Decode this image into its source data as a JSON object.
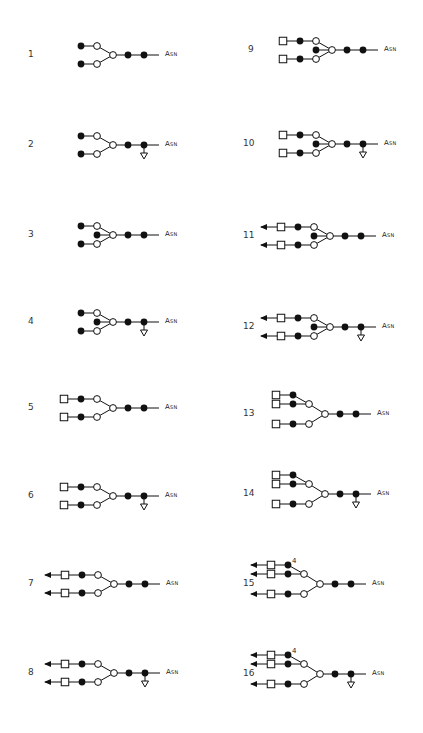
{
  "figure": {
    "terminal_label": "Asn",
    "legend_symbols": {
      "filled_circle": "GlcNAc",
      "open_circle": "Man",
      "open_square": "Gal",
      "arrow": "Sia",
      "open_triangle": "Fuc"
    },
    "structures": [
      {
        "id": "1",
        "label": "1",
        "col": 0,
        "y": 55,
        "antennae": 2,
        "bisect": false,
        "fuc": false,
        "gal": false,
        "sia": false,
        "tri": false
      },
      {
        "id": "2",
        "label": "2",
        "col": 0,
        "y": 145,
        "antennae": 2,
        "bisect": false,
        "fuc": true,
        "gal": false,
        "sia": false,
        "tri": false
      },
      {
        "id": "3",
        "label": "3",
        "col": 0,
        "y": 235,
        "antennae": 2,
        "bisect": true,
        "fuc": false,
        "gal": false,
        "sia": false,
        "tri": false
      },
      {
        "id": "4",
        "label": "4",
        "col": 0,
        "y": 322,
        "antennae": 2,
        "bisect": true,
        "fuc": true,
        "gal": false,
        "sia": false,
        "tri": false
      },
      {
        "id": "5",
        "label": "5",
        "col": 0,
        "y": 408,
        "antennae": 2,
        "bisect": false,
        "fuc": false,
        "gal": true,
        "sia": false,
        "tri": false
      },
      {
        "id": "6",
        "label": "6",
        "col": 0,
        "y": 496,
        "antennae": 2,
        "bisect": false,
        "fuc": true,
        "gal": true,
        "sia": false,
        "tri": false
      },
      {
        "id": "7",
        "label": "7",
        "col": 0,
        "y": 584,
        "antennae": 2,
        "bisect": false,
        "fuc": false,
        "gal": true,
        "sia": true,
        "tri": false
      },
      {
        "id": "8",
        "label": "8",
        "col": 0,
        "y": 673,
        "antennae": 2,
        "bisect": false,
        "fuc": true,
        "gal": true,
        "sia": true,
        "tri": false
      },
      {
        "id": "9",
        "label": "9",
        "col": 1,
        "y": 50,
        "antennae": 2,
        "bisect": true,
        "fuc": false,
        "gal": true,
        "sia": false,
        "tri": false
      },
      {
        "id": "10",
        "label": "10",
        "col": 1,
        "y": 144,
        "antennae": 2,
        "bisect": true,
        "fuc": true,
        "gal": true,
        "sia": false,
        "tri": false
      },
      {
        "id": "11",
        "label": "11",
        "col": 1,
        "y": 236,
        "antennae": 2,
        "bisect": true,
        "fuc": false,
        "gal": true,
        "sia": true,
        "tri": false
      },
      {
        "id": "12",
        "label": "12",
        "col": 1,
        "y": 327,
        "antennae": 2,
        "bisect": true,
        "fuc": true,
        "gal": true,
        "sia": true,
        "tri": false
      },
      {
        "id": "13",
        "label": "13",
        "col": 1,
        "y": 414,
        "antennae": 3,
        "bisect": false,
        "fuc": false,
        "gal": true,
        "sia": false,
        "tri": true
      },
      {
        "id": "14",
        "label": "14",
        "col": 1,
        "y": 494,
        "antennae": 3,
        "bisect": false,
        "fuc": true,
        "gal": true,
        "sia": false,
        "tri": true
      },
      {
        "id": "15",
        "label": "15",
        "col": 1,
        "y": 584,
        "antennae": 3,
        "bisect": false,
        "fuc": false,
        "gal": true,
        "sia": true,
        "tri": true,
        "link_label": "4"
      },
      {
        "id": "16",
        "label": "16",
        "col": 1,
        "y": 674,
        "antennae": 3,
        "bisect": false,
        "fuc": true,
        "gal": true,
        "sia": true,
        "tri": true,
        "link_label": "4"
      }
    ]
  },
  "labels": {
    "s1": "1",
    "s2": "2",
    "s3": "3",
    "s4": "4",
    "s5": "5",
    "s6": "6",
    "s7": "7",
    "s8": "8",
    "s9": "9",
    "s10": "10",
    "s11": "11",
    "s12": "12",
    "s13": "13",
    "s14": "14",
    "s15": "15",
    "s16": "16",
    "asn": "Asn",
    "link4": "4"
  }
}
